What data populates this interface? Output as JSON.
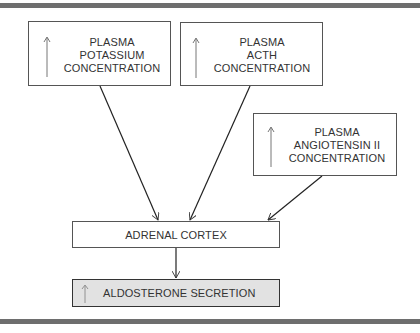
{
  "diagram": {
    "inputs": [
      {
        "id": "potassium",
        "indicator": "increase",
        "lines": [
          "PLASMA",
          "POTASSIUM",
          "CONCENTRATION"
        ]
      },
      {
        "id": "acth",
        "indicator": "increase",
        "lines": [
          "PLASMA",
          "ACTH",
          "CONCENTRATION"
        ]
      },
      {
        "id": "angiotensin",
        "indicator": "increase",
        "lines": [
          "PLASMA",
          "ANGIOTENSIN II",
          "CONCENTRATION"
        ]
      }
    ],
    "target": {
      "label": "ADRENAL CORTEX"
    },
    "output": {
      "indicator": "increase",
      "label": "ALDOSTERONE SECRETION",
      "fill": "#e2e2e2"
    },
    "edges": [
      {
        "from": "potassium",
        "to": "adrenal-cortex"
      },
      {
        "from": "acth",
        "to": "adrenal-cortex"
      },
      {
        "from": "angiotensin",
        "to": "adrenal-cortex"
      },
      {
        "from": "adrenal-cortex",
        "to": "aldosterone-secretion"
      }
    ]
  }
}
